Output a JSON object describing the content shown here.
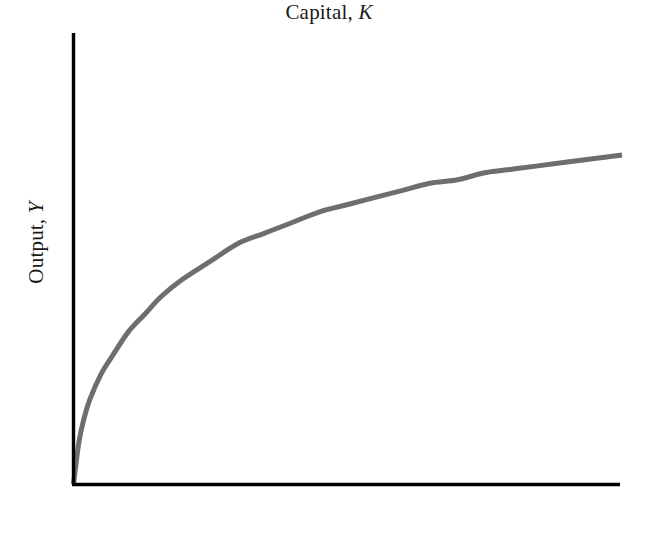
{
  "figure": {
    "background_color": "#ffffff",
    "axis_color": "#000000",
    "curve_color": "#6e6e6e"
  },
  "axes": {
    "x": {
      "label_text": "Capital,",
      "label_variable": "K",
      "full_label": "Capital, K"
    },
    "y": {
      "label_text": "Output,",
      "label_variable": "Y",
      "full_label": "Output, Y"
    }
  },
  "chart_data": {
    "type": "line",
    "title": "",
    "subtitle": "",
    "xlabel": "Capital, K",
    "ylabel": "Output, Y",
    "legend": [],
    "legend_position": "none",
    "grid": false,
    "ticks": {
      "x": [],
      "y": []
    },
    "xlim": [
      0,
      100
    ],
    "ylim": [
      0,
      100
    ],
    "annotations": [],
    "series": [
      {
        "name": "Production function, Y = F(K)",
        "color": "#6e6e6e",
        "line_width": 5,
        "x": [
          0,
          1,
          2,
          3,
          5,
          7,
          10,
          13,
          16,
          20,
          25,
          30,
          35,
          40,
          45,
          50,
          55,
          60,
          65,
          70,
          75,
          80,
          85,
          90,
          95,
          100
        ],
        "y": [
          0,
          12,
          19,
          24,
          31,
          36,
          43,
          48,
          53,
          58,
          63,
          68,
          71,
          74,
          77,
          79,
          81,
          83,
          85,
          86,
          88,
          89,
          90,
          91,
          92,
          93
        ]
      }
    ]
  }
}
